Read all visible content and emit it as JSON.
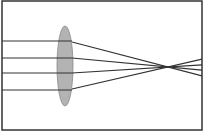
{
  "diagram": {
    "frame": {
      "x": 2,
      "y": 1,
      "w": 200,
      "h": 129,
      "stroke": "#333333"
    },
    "lens": {
      "cx": 65,
      "cy": 66,
      "rx": 8,
      "ry": 40,
      "fill": "#b3b3b3",
      "stroke": "#888888"
    },
    "focal_point": {
      "x": 168,
      "y": 67
    },
    "ray_color": "#333333",
    "rays": [
      {
        "y": 41,
        "exit_y": 42
      },
      {
        "y": 58,
        "exit_y": 58
      },
      {
        "y": 73,
        "exit_y": 73
      },
      {
        "y": 90,
        "exit_y": 89
      }
    ]
  }
}
